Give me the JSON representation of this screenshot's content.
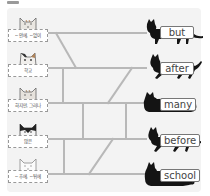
{
  "puzzle": {
    "type": "ladder-matching",
    "rail_color": "#b8b8b8",
    "panel_color": "#f3f3f3",
    "left_items": [
      {
        "label": "~안에, ~없이",
        "kitten": "tabby-kitten"
      },
      {
        "label": "학교",
        "kitten": "calico-kitten"
      },
      {
        "label": "하지만, 그러나",
        "kitten": "tabby-kitten"
      },
      {
        "label": "많은",
        "kitten": "black-white-kitten"
      },
      {
        "label": "~후에, ~뒤에",
        "kitten": "white-kitten"
      }
    ],
    "right_items": [
      {
        "word": "but"
      },
      {
        "word": "after"
      },
      {
        "word": "many"
      },
      {
        "word": "before"
      },
      {
        "word": "school"
      }
    ]
  }
}
